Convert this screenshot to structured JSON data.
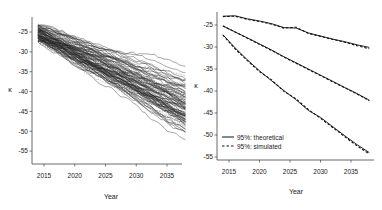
{
  "chart_data": [
    {
      "type": "line",
      "title": "",
      "xlabel": "Year",
      "ylabel": "κ",
      "xlim": [
        2013.5,
        2038
      ],
      "ylim": [
        -58,
        -22
      ],
      "x_ticks": [
        2015,
        2020,
        2025,
        2030,
        2035
      ],
      "y_ticks": [
        -25,
        -30,
        -35,
        -40,
        -45,
        -50,
        -55
      ],
      "grid": false,
      "legend": null,
      "description": "About 100 simulated κ trajectories (solid and dashed grey/black lines) starting near -25 in 2014 and fanning out downward to between about -27 and -56 by 2038; the dense core ends near -43.",
      "series_summary": {
        "start_year": 2014,
        "end_year": 2038,
        "start_range": [
          -27,
          -23
        ],
        "end_range": [
          -56,
          -27
        ],
        "median_end": -43
      }
    },
    {
      "type": "line",
      "title": "",
      "xlabel": "Year",
      "ylabel": "κ",
      "xlim": [
        2013.5,
        2038
      ],
      "ylim": [
        -56,
        -22
      ],
      "x_ticks": [
        2015,
        2020,
        2025,
        2030,
        2035
      ],
      "y_ticks": [
        -25,
        -30,
        -35,
        -40,
        -45,
        -50,
        -55
      ],
      "grid": false,
      "legend": {
        "position": "bottom-left",
        "entries": [
          "95%: theoretical",
          "95%: simulated"
        ]
      },
      "x": [
        2014,
        2016,
        2018,
        2020,
        2022,
        2024,
        2026,
        2028,
        2030,
        2032,
        2034,
        2036,
        2038
      ],
      "series": [
        {
          "name": "95%: theoretical (upper)",
          "style": "solid",
          "values": [
            -23.0,
            -22.9,
            -23.6,
            -24.1,
            -24.7,
            -25.6,
            -25.7,
            -26.8,
            -27.5,
            -28.2,
            -28.8,
            -29.5,
            -30.1
          ]
        },
        {
          "name": "95%: simulated (upper)",
          "style": "dashed",
          "values": [
            -23.1,
            -23.0,
            -23.7,
            -24.2,
            -24.8,
            -25.7,
            -25.5,
            -26.9,
            -27.6,
            -28.3,
            -28.9,
            -29.7,
            -30.4
          ]
        },
        {
          "name": "theoretical (median)",
          "style": "solid",
          "values": [
            -25.2,
            -26.6,
            -27.9,
            -29.3,
            -30.7,
            -32.2,
            -33.6,
            -35.0,
            -36.4,
            -37.8,
            -39.2,
            -40.6,
            -42.1
          ]
        },
        {
          "name": "simulated (median)",
          "style": "dashed",
          "values": [
            -25.2,
            -26.6,
            -28.0,
            -29.4,
            -30.8,
            -32.3,
            -33.7,
            -35.1,
            -36.5,
            -37.9,
            -39.3,
            -40.7,
            -42.2
          ]
        },
        {
          "name": "95%: theoretical (lower)",
          "style": "solid",
          "values": [
            -27.2,
            -30.2,
            -32.9,
            -35.4,
            -37.7,
            -39.9,
            -42.0,
            -44.4,
            -46.0,
            -48.1,
            -50.2,
            -52.2,
            -54.0
          ]
        },
        {
          "name": "95%: simulated (lower)",
          "style": "dashed",
          "values": [
            -27.3,
            -30.4,
            -33.1,
            -35.6,
            -37.5,
            -40.1,
            -41.8,
            -44.2,
            -46.2,
            -48.3,
            -50.4,
            -52.5,
            -54.3
          ]
        }
      ]
    }
  ],
  "panels": {
    "left": {
      "xlabel": "Year",
      "ylabel": "κ",
      "x_ticks": [
        "2015",
        "2020",
        "2025",
        "2030",
        "2035"
      ],
      "y_ticks": [
        "-25",
        "-30",
        "-35",
        "-40",
        "-45",
        "-50",
        "-55"
      ]
    },
    "right": {
      "xlabel": "Year",
      "ylabel": "κ",
      "x_ticks": [
        "2015",
        "2020",
        "2025",
        "2030",
        "2035"
      ],
      "y_ticks": [
        "-25",
        "-30",
        "-35",
        "-40",
        "-45",
        "-50",
        "-55"
      ],
      "legend": {
        "theoretical": "95%: theoretical",
        "simulated": "95%: simulated"
      }
    }
  }
}
